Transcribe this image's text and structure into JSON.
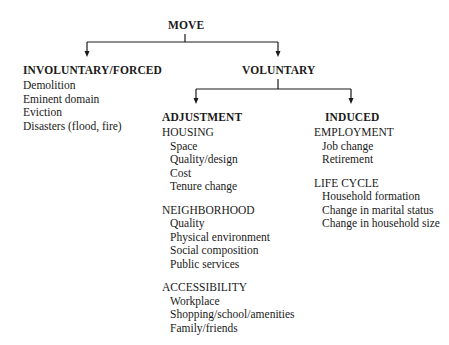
{
  "root": {
    "label": "MOVE"
  },
  "involuntary": {
    "label": "INVOLUNTARY/FORCED",
    "items": [
      "Demolition",
      "Eminent domain",
      "Eviction",
      "Disasters (flood, fire)"
    ]
  },
  "voluntary": {
    "label": "VOLUNTARY",
    "adjustment": {
      "label": "ADJUSTMENT",
      "groups": [
        {
          "label": "HOUSING",
          "items": [
            "Space",
            "Quality/design",
            "Cost",
            "Tenure change"
          ]
        },
        {
          "label": "NEIGHBORHOOD",
          "items": [
            "Quality",
            "Physical environment",
            "Social composition",
            "Public services"
          ]
        },
        {
          "label": "ACCESSIBILITY",
          "items": [
            "Workplace",
            "Shopping/school/amenities",
            "Family/friends"
          ]
        }
      ]
    },
    "induced": {
      "label": "INDUCED",
      "groups": [
        {
          "label": "EMPLOYMENT",
          "items": [
            "Job change",
            "Retirement"
          ]
        },
        {
          "label": "LIFE CYCLE",
          "items": [
            "Household formation",
            "Change in marital status",
            "Change in household size"
          ]
        }
      ]
    }
  },
  "colors": {
    "line": "#1a1a1a",
    "text": "#1a1a1a",
    "background": "#ffffff"
  }
}
